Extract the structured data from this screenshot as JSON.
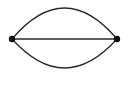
{
  "diagram": {
    "type": "multigraph",
    "background": "#ffffff",
    "stroke_color": "#2a2a2a",
    "node_color": "#111111",
    "nodes": [
      {
        "id": "left",
        "x": 12,
        "y": 39
      },
      {
        "id": "right",
        "x": 117,
        "y": 39
      }
    ],
    "edges": [
      {
        "id": "top-arc",
        "from": "left",
        "to": "right",
        "shape": "arc-up"
      },
      {
        "id": "straight",
        "from": "left",
        "to": "right",
        "shape": "line"
      },
      {
        "id": "bottom-arc",
        "from": "left",
        "to": "right",
        "shape": "arc-down"
      }
    ]
  }
}
